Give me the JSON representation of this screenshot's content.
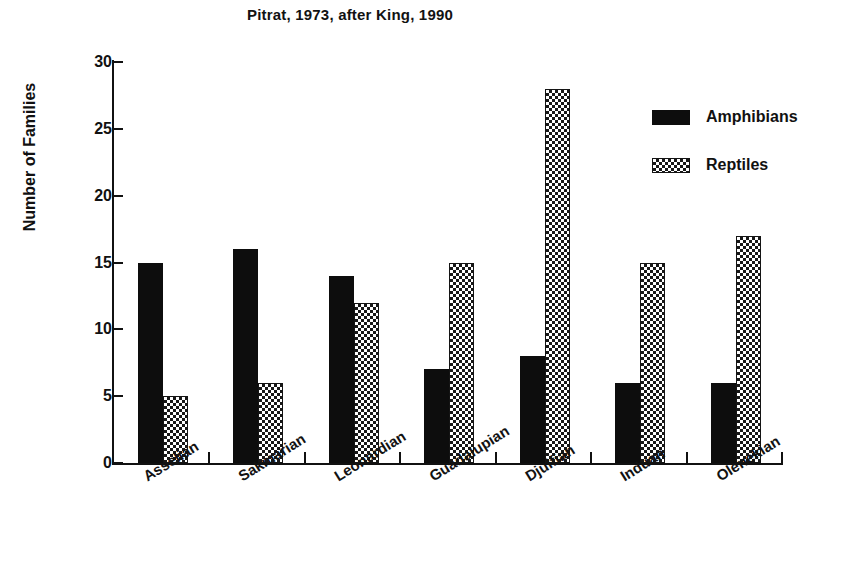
{
  "chart_data": {
    "type": "bar",
    "title": "Pitrat, 1973, after King, 1990",
    "xlabel": "",
    "ylabel": "Number of Families",
    "ylim": [
      0,
      30
    ],
    "yticks": [
      0,
      5,
      10,
      15,
      20,
      25,
      30
    ],
    "grid": false,
    "legend_position": "top-right",
    "categories": [
      "Asselian",
      "Sakmarian",
      "Leonardian",
      "Guadalupian",
      "Djulfian",
      "Induan",
      "Olenekian"
    ],
    "series": [
      {
        "name": "Amphibians",
        "values": [
          15,
          16,
          14,
          7,
          8,
          6,
          6
        ],
        "color": "#0d0d0d",
        "fill": "solid"
      },
      {
        "name": "Reptiles",
        "values": [
          5,
          6,
          12,
          15,
          28,
          15,
          17
        ],
        "color": "#171717",
        "fill": "checkered"
      }
    ]
  },
  "legend": {
    "items": [
      {
        "label": "Amphibians",
        "swatch": "solid-black-swatch"
      },
      {
        "label": "Reptiles",
        "swatch": "checkered-swatch"
      }
    ]
  },
  "colors": {
    "axis": "#111111",
    "amphibians": "#0d0d0d",
    "reptiles": "#171717",
    "background": "#ffffff"
  }
}
